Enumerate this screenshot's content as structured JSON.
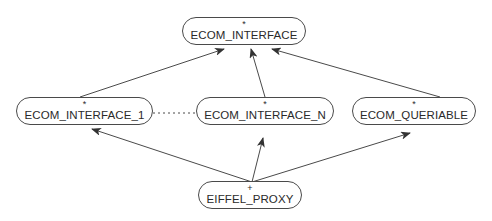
{
  "diagram": {
    "type": "inheritance-graph",
    "colors": {
      "stroke": "#4a4a4a",
      "text": "#2a2a2a",
      "background": "#ffffff"
    },
    "nodes": [
      {
        "id": "ecom_interface",
        "label": "ECOM_INTERFACE",
        "mark": "*"
      },
      {
        "id": "ecom_interface_1",
        "label": "ECOM_INTERFACE_1",
        "mark": "*"
      },
      {
        "id": "ecom_interface_n",
        "label": "ECOM_INTERFACE_N",
        "mark": "*"
      },
      {
        "id": "ecom_queriable",
        "label": "ECOM_QUERIABLE",
        "mark": "*"
      },
      {
        "id": "eiffel_proxy",
        "label": "EIFFEL_PROXY",
        "mark": "+"
      }
    ],
    "edges": [
      {
        "from": "ecom_interface_1",
        "to": "ecom_interface",
        "style": "solid-arrow"
      },
      {
        "from": "ecom_interface_n",
        "to": "ecom_interface",
        "style": "solid-arrow"
      },
      {
        "from": "ecom_queriable",
        "to": "ecom_interface",
        "style": "solid-arrow"
      },
      {
        "from": "eiffel_proxy",
        "to": "ecom_interface_1",
        "style": "solid-arrow"
      },
      {
        "from": "eiffel_proxy",
        "to": "ecom_interface_n",
        "style": "solid-arrow"
      },
      {
        "from": "eiffel_proxy",
        "to": "ecom_queriable",
        "style": "solid-arrow"
      },
      {
        "from": "ecom_interface_1",
        "to": "ecom_interface_n",
        "style": "dotted-line"
      }
    ]
  }
}
